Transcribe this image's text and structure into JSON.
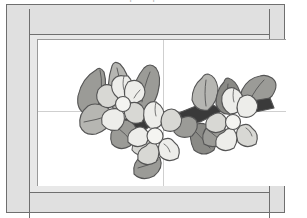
{
  "page": {
    "caption": "clip art preview"
  },
  "frame": {
    "outer_border_color": "#6f6f6f",
    "moulding_color": "#e0e0e0",
    "mat_color": "#e8e8e8",
    "canvas_color": "#ffffff",
    "guide_line_color": "#cfcfcf",
    "rails": [
      {
        "name": "left-rail",
        "label": "Left frame rail"
      },
      {
        "name": "right-rail",
        "label": "Right frame rail"
      },
      {
        "name": "top-rail",
        "label": "Top frame rail"
      },
      {
        "name": "bottom-rail",
        "label": "Bottom frame rail"
      }
    ]
  },
  "artwork": {
    "name": "Dogwood Flower Branch",
    "style": "grayscale clip art",
    "outline_color": "#555555",
    "palette": {
      "petal_light": "#ededea",
      "petal_mid": "#d8d8d4",
      "petal_shadow": "#c3c3bf",
      "center": "#f4f4f1",
      "leaf_light": "#b6b6b2",
      "leaf_mid": "#9b9b97",
      "leaf_dark": "#8a8a86",
      "stem_dark": "#3a3a3a"
    },
    "flowers": [
      {
        "id": "flower-left",
        "label": "Left dogwood blossom",
        "petals": 5
      },
      {
        "id": "flower-center",
        "label": "Center dogwood blossom",
        "petals": 5
      },
      {
        "id": "flower-right",
        "label": "Right dogwood blossom",
        "petals": 5
      }
    ],
    "leaf_count": 10,
    "stem_count": 3
  }
}
